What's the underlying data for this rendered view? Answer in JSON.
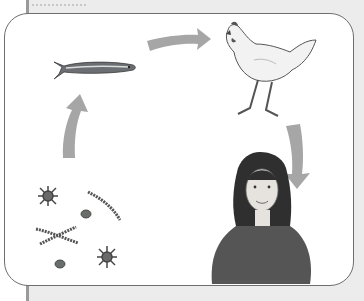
{
  "diagram": {
    "type": "food-chain-cycle",
    "nodes": [
      {
        "id": "plankton",
        "label": "plankton / microorganisms",
        "icon": "plankton-icon"
      },
      {
        "id": "fish",
        "label": "fish",
        "icon": "fish-icon"
      },
      {
        "id": "chicken",
        "label": "chicken",
        "icon": "chicken-icon"
      },
      {
        "id": "human",
        "label": "girl",
        "icon": "person-icon"
      }
    ],
    "edges": [
      {
        "from": "plankton",
        "to": "fish"
      },
      {
        "from": "fish",
        "to": "chicken"
      },
      {
        "from": "chicken",
        "to": "human"
      }
    ],
    "colors": {
      "arrow": "#a6a6a6",
      "frame_border": "#6e6e6e",
      "background": "#ececec"
    }
  }
}
